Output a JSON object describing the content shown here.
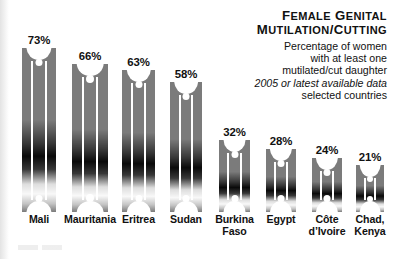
{
  "title": {
    "line1_major": "F",
    "line1_rest1": "EMALE",
    "line1_major2": "G",
    "line1_rest2": "ENITAL",
    "line2_major": "M",
    "line2_rest1": "UTILATION",
    "line2_slash": "/",
    "line2_major2": "C",
    "line2_rest2": "UTTING",
    "full": "Female Genital Mutilation/Cutting"
  },
  "subtitle": {
    "l1": "Percentage of women",
    "l2": "with at least one",
    "l3": "mutilated/cut daughter",
    "l4_italic": "2005 or latest available data",
    "l5": "selected countries"
  },
  "colors": {
    "bar_gray": "#7b7b7b",
    "bar_dark": "#000000",
    "text": "#111111",
    "background": "#ffffff",
    "stripe": "#ffffff"
  },
  "chart_data": {
    "type": "bar",
    "title": "Female Genital Mutilation/Cutting",
    "subtitle": "Percentage of women with at least one mutilated/cut daughter, 2005 or latest available data, selected countries",
    "xlabel": "",
    "ylabel": "Percentage of women",
    "ylim": [
      0,
      73
    ],
    "grid": false,
    "legend": false,
    "value_suffix": "%",
    "categories": [
      "Mali",
      "Mauritania",
      "Eritrea",
      "Sudan",
      "Burkina Faso",
      "Egypt",
      "Côte d’Ivoire",
      "Chad, Kenya"
    ],
    "category_lines": [
      [
        "Mali"
      ],
      [
        "Mauritania"
      ],
      [
        "Eritrea"
      ],
      [
        "Sudan"
      ],
      [
        "Burkina",
        "Faso"
      ],
      [
        "Egypt"
      ],
      [
        "Côte",
        "d’Ivoire"
      ],
      [
        "Chad,",
        "Kenya"
      ]
    ],
    "values": [
      73,
      66,
      63,
      58,
      32,
      28,
      24,
      21
    ],
    "value_labels": [
      "73%",
      "66%",
      "63%",
      "58%",
      "32%",
      "28%",
      "24%",
      "21%"
    ]
  }
}
